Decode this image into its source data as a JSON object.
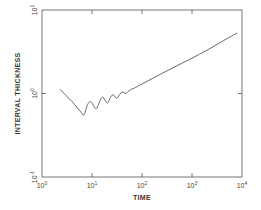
{
  "chart_data": {
    "type": "line",
    "title": "",
    "xlabel": "TIME",
    "ylabel": "INTERVAL THICKNESS",
    "xscale": "log",
    "yscale": "log",
    "xlim": [
      1,
      10000
    ],
    "ylim": [
      0.1,
      10
    ],
    "grid": false,
    "legend": null,
    "x_ticks": [
      {
        "base": "10",
        "exp": "0",
        "value": 1
      },
      {
        "base": "10",
        "exp": "1",
        "value": 10
      },
      {
        "base": "10",
        "exp": "2",
        "value": 100
      },
      {
        "base": "10",
        "exp": "3",
        "value": 1000
      },
      {
        "base": "10",
        "exp": "4",
        "value": 10000
      }
    ],
    "y_ticks": [
      {
        "base": "10",
        "exp": "-1",
        "value": 0.1
      },
      {
        "base": "10",
        "exp": "0",
        "value": 1
      },
      {
        "base": "10",
        "exp": "1",
        "value": 10
      }
    ],
    "series": [
      {
        "name": "interval thickness",
        "color": "#555555",
        "points": [
          [
            2.3,
            1.12
          ],
          [
            3.0,
            0.95
          ],
          [
            4.0,
            0.8
          ],
          [
            5.0,
            0.68
          ],
          [
            6.0,
            0.6
          ],
          [
            6.8,
            0.55
          ],
          [
            7.4,
            0.62
          ],
          [
            8.2,
            0.74
          ],
          [
            9.2,
            0.8
          ],
          [
            10.2,
            0.76
          ],
          [
            11.2,
            0.68
          ],
          [
            12.2,
            0.66
          ],
          [
            13.5,
            0.74
          ],
          [
            15.0,
            0.86
          ],
          [
            16.5,
            0.9
          ],
          [
            18.0,
            0.84
          ],
          [
            19.5,
            0.78
          ],
          [
            21.0,
            0.78
          ],
          [
            23.0,
            0.88
          ],
          [
            25.5,
            0.96
          ],
          [
            28.0,
            0.94
          ],
          [
            30.5,
            0.88
          ],
          [
            33.0,
            0.9
          ],
          [
            36.0,
            0.98
          ],
          [
            40.0,
            1.04
          ],
          [
            44.0,
            1.02
          ],
          [
            48.0,
            1.0
          ],
          [
            53.0,
            1.06
          ],
          [
            60.0,
            1.12
          ],
          [
            70.0,
            1.16
          ],
          [
            100.0,
            1.3
          ],
          [
            200.0,
            1.62
          ],
          [
            500.0,
            2.15
          ],
          [
            1000.0,
            2.65
          ],
          [
            2000.0,
            3.3
          ],
          [
            4000.0,
            4.2
          ],
          [
            8000.0,
            5.3
          ]
        ]
      }
    ]
  }
}
